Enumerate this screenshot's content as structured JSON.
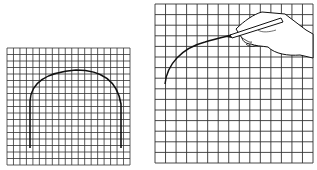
{
  "figure": {
    "panels": [
      {
        "id": "left",
        "description": "Grid with drawn arch outline (flat base, rounded top)",
        "grid": {
          "x": 7,
          "y": 48,
          "width": 123,
          "height": 117,
          "cols": 19,
          "rows": 18
        },
        "shape": "arch"
      },
      {
        "id": "right",
        "description": "Larger grid with hand holding pencil drawing a curve",
        "grid": {
          "x": 155,
          "y": 4,
          "width": 158,
          "height": 159,
          "cols": 15,
          "rows": 15
        },
        "shape": "curve-with-hand"
      }
    ],
    "colors": {
      "line": "#222222",
      "grid": "#333333",
      "background": "#ffffff"
    }
  }
}
